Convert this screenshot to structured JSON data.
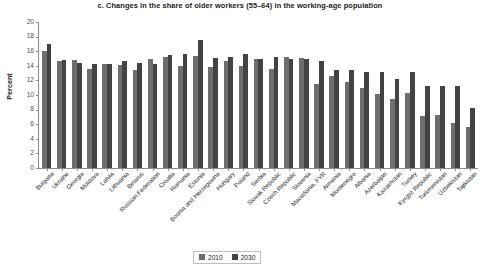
{
  "chart_data": {
    "type": "bar",
    "title": "c. Changes in the share of older workers (55–64) in the working-age population",
    "xlabel": "",
    "ylabel": "Percent",
    "ylim": [
      0,
      20
    ],
    "ytick_step": 2,
    "yticks": [
      "20",
      "18",
      "16",
      "14",
      "12",
      "10",
      "8",
      "6",
      "4",
      "2",
      "0"
    ],
    "grid": false,
    "legend_position": "bottom-center",
    "categories": [
      "Bulgaria",
      "Ukraine",
      "Georgia",
      "Moldova",
      "Latvia",
      "Lithuania",
      "Belarus",
      "Russian Federation",
      "Croatia",
      "Romania",
      "Estonia",
      "Bosnia and Herzegovina",
      "Hungary",
      "Poland",
      "Serbia",
      "Slovak Republic",
      "Czech Republic",
      "Slovenia",
      "Macedonia, FYR",
      "Armenia",
      "Montenegro",
      "Albania",
      "Azerbaijan",
      "Kazakhstan",
      "Turkey",
      "Kyrgyz Republic",
      "Turkmenistan",
      "Uzbekistan",
      "Tajikistan"
    ],
    "series": [
      {
        "name": "2010",
        "color": "#6e6e6e",
        "values": [
          16.0,
          14.6,
          14.8,
          13.6,
          14.3,
          14.1,
          13.4,
          14.9,
          15.2,
          14.0,
          15.4,
          13.8,
          14.7,
          14.0,
          15.0,
          13.6,
          15.2,
          15.1,
          11.5,
          12.6,
          11.8,
          10.9,
          10.1,
          9.4,
          10.3,
          7.1,
          7.3,
          6.2,
          5.6
        ]
      },
      {
        "name": "2030",
        "color": "#434343",
        "values": [
          17.0,
          14.8,
          14.4,
          14.2,
          14.3,
          14.6,
          14.4,
          14.2,
          15.5,
          15.6,
          17.5,
          15.1,
          15.2,
          15.6,
          15.0,
          15.2,
          14.9,
          15.0,
          14.6,
          13.4,
          13.4,
          13.2,
          13.2,
          12.2,
          13.2,
          11.3,
          11.2,
          11.2,
          8.2
        ]
      }
    ]
  },
  "legend": {
    "items": [
      {
        "label": "2010",
        "color": "#6e6e6e"
      },
      {
        "label": "2030",
        "color": "#434343"
      }
    ]
  }
}
